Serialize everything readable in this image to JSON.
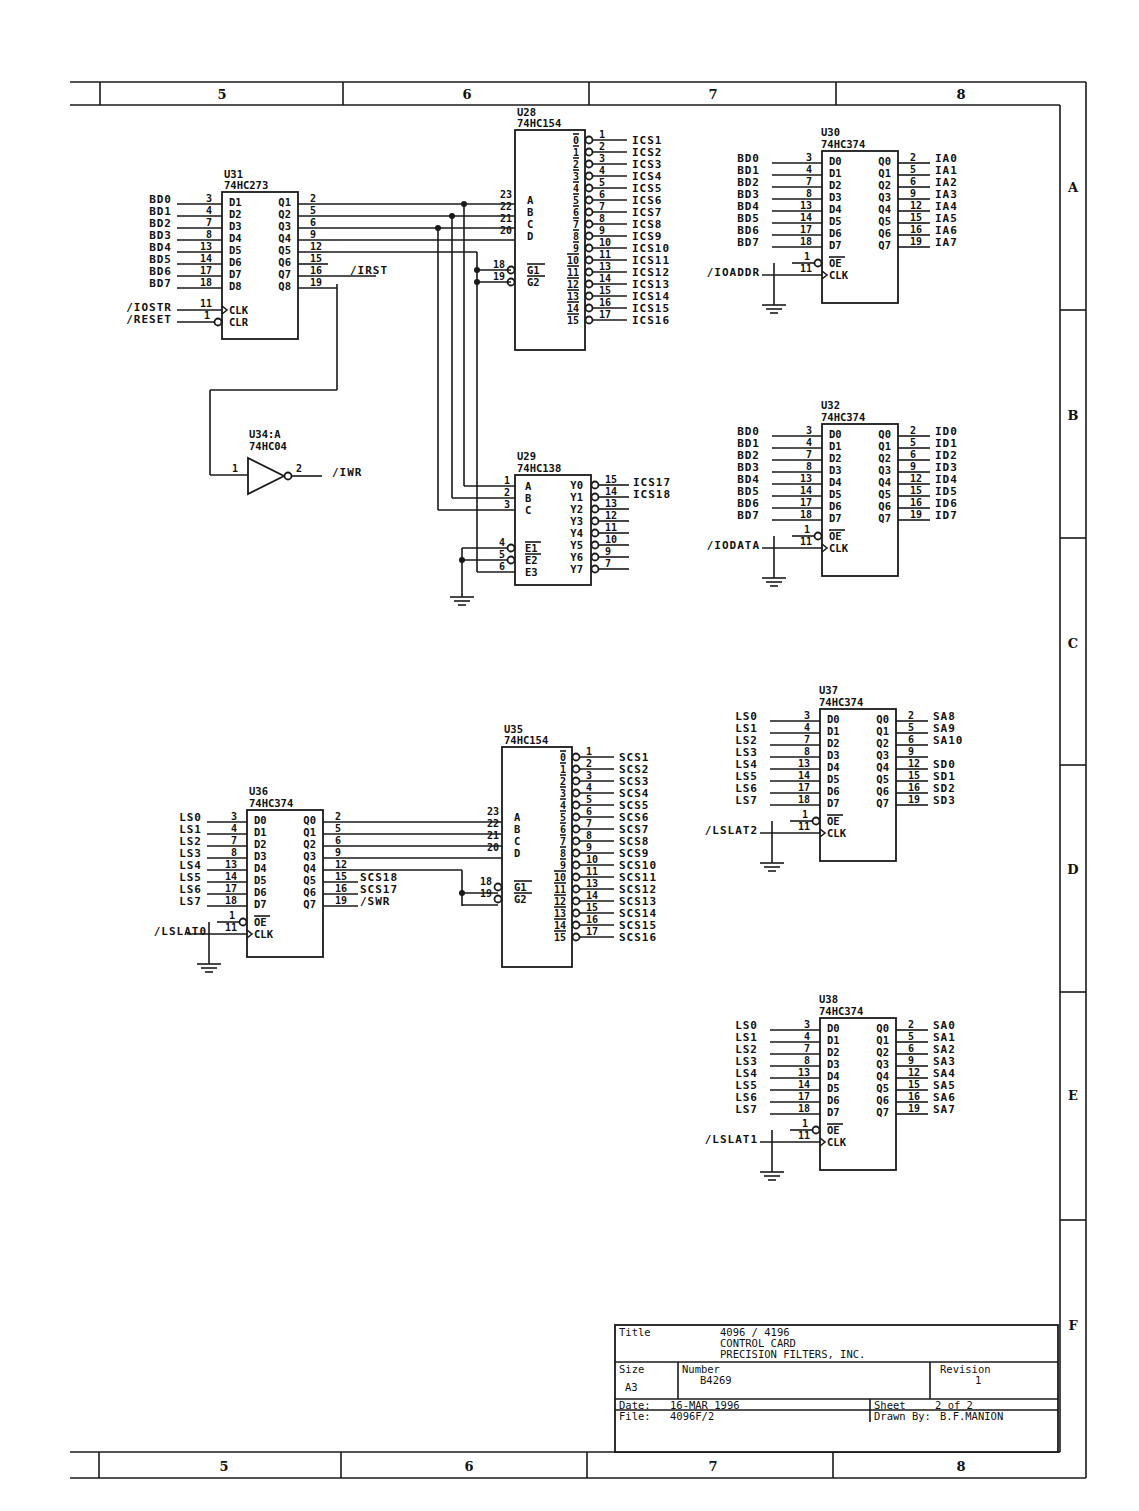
{
  "border": {
    "columns": [
      "5",
      "6",
      "7",
      "8"
    ],
    "rows": [
      "A",
      "B",
      "C",
      "D",
      "E",
      "F"
    ]
  },
  "chips": {
    "u31": {
      "ref": "U31",
      "part": "74HC273",
      "inputs": [
        {
          "sig": "BD0",
          "pin": "3",
          "name": "D1"
        },
        {
          "sig": "BD1",
          "pin": "4",
          "name": "D2"
        },
        {
          "sig": "BD2",
          "pin": "7",
          "name": "D3"
        },
        {
          "sig": "BD3",
          "pin": "8",
          "name": "D4"
        },
        {
          "sig": "BD4",
          "pin": "13",
          "name": "D5"
        },
        {
          "sig": "BD5",
          "pin": "14",
          "name": "D6"
        },
        {
          "sig": "BD6",
          "pin": "17",
          "name": "D7"
        },
        {
          "sig": "BD7",
          "pin": "18",
          "name": "D8"
        }
      ],
      "outputs": [
        {
          "pin": "2",
          "name": "Q1"
        },
        {
          "pin": "5",
          "name": "Q2"
        },
        {
          "pin": "6",
          "name": "Q3"
        },
        {
          "pin": "9",
          "name": "Q4"
        },
        {
          "pin": "12",
          "name": "Q5"
        },
        {
          "pin": "15",
          "name": "Q6"
        },
        {
          "pin": "16",
          "name": "Q7",
          "sig": "/IRST"
        },
        {
          "pin": "19",
          "name": "Q8"
        }
      ],
      "clk": {
        "sig": "/IOSTR",
        "pin": "11",
        "name": "CLK"
      },
      "clr": {
        "sig": "/RESET",
        "pin": "1",
        "name": "CLR"
      }
    },
    "u28": {
      "ref": "U28",
      "part": "74HC154",
      "inputs": [
        {
          "pin": "23",
          "name": "A"
        },
        {
          "pin": "22",
          "name": "B"
        },
        {
          "pin": "21",
          "name": "C"
        },
        {
          "pin": "20",
          "name": "D"
        }
      ],
      "gates": [
        {
          "pin": "18",
          "name": "G1"
        },
        {
          "pin": "19",
          "name": "G2"
        }
      ],
      "outputs": [
        {
          "n": "0",
          "pin": "1",
          "sig": "ICS1"
        },
        {
          "n": "1",
          "pin": "2",
          "sig": "ICS2"
        },
        {
          "n": "2",
          "pin": "3",
          "sig": "ICS3"
        },
        {
          "n": "3",
          "pin": "4",
          "sig": "ICS4"
        },
        {
          "n": "4",
          "pin": "5",
          "sig": "ICS5"
        },
        {
          "n": "5",
          "pin": "6",
          "sig": "ICS6"
        },
        {
          "n": "6",
          "pin": "7",
          "sig": "ICS7"
        },
        {
          "n": "7",
          "pin": "8",
          "sig": "ICS8"
        },
        {
          "n": "8",
          "pin": "9",
          "sig": "ICS9"
        },
        {
          "n": "9",
          "pin": "10",
          "sig": "ICS10"
        },
        {
          "n": "10",
          "pin": "11",
          "sig": "ICS11"
        },
        {
          "n": "11",
          "pin": "13",
          "sig": "ICS12"
        },
        {
          "n": "12",
          "pin": "14",
          "sig": "ICS13"
        },
        {
          "n": "13",
          "pin": "15",
          "sig": "ICS14"
        },
        {
          "n": "14",
          "pin": "16",
          "sig": "ICS15"
        },
        {
          "n": "15",
          "pin": "17",
          "sig": "ICS16"
        }
      ]
    },
    "u29": {
      "ref": "U29",
      "part": "74HC138",
      "inputs": [
        {
          "pin": "1",
          "name": "A"
        },
        {
          "pin": "2",
          "name": "B"
        },
        {
          "pin": "3",
          "name": "C"
        }
      ],
      "enables": [
        {
          "pin": "4",
          "name": "E1"
        },
        {
          "pin": "5",
          "name": "E2"
        },
        {
          "pin": "6",
          "name": "E3"
        }
      ],
      "outputs": [
        {
          "name": "Y0",
          "pin": "15",
          "sig": "ICS17"
        },
        {
          "name": "Y1",
          "pin": "14",
          "sig": "ICS18"
        },
        {
          "name": "Y2",
          "pin": "13"
        },
        {
          "name": "Y3",
          "pin": "12"
        },
        {
          "name": "Y4",
          "pin": "11"
        },
        {
          "name": "Y5",
          "pin": "10"
        },
        {
          "name": "Y6",
          "pin": "9"
        },
        {
          "name": "Y7",
          "pin": "7"
        }
      ]
    },
    "u34": {
      "ref": "U34:A",
      "part": "74HC04",
      "in_pin": "1",
      "out_pin": "2",
      "out_sig": "/IWR"
    },
    "u30": {
      "ref": "U30",
      "part": "74HC374",
      "clk_sig": "/IOADDR",
      "in_sigs": [
        "BD0",
        "BD1",
        "BD2",
        "BD3",
        "BD4",
        "BD5",
        "BD6",
        "BD7"
      ],
      "out_sigs": [
        "IA0",
        "IA1",
        "IA2",
        "IA3",
        "IA4",
        "IA5",
        "IA6",
        "IA7"
      ]
    },
    "u32": {
      "ref": "U32",
      "part": "74HC374",
      "clk_sig": "/IODATA",
      "in_sigs": [
        "BD0",
        "BD1",
        "BD2",
        "BD3",
        "BD4",
        "BD5",
        "BD6",
        "BD7"
      ],
      "out_sigs": [
        "ID0",
        "ID1",
        "ID2",
        "ID3",
        "ID4",
        "ID5",
        "ID6",
        "ID7"
      ]
    },
    "u37": {
      "ref": "U37",
      "part": "74HC374",
      "clk_sig": "/LSLAT2",
      "in_sigs": [
        "LS0",
        "LS1",
        "LS2",
        "LS3",
        "LS4",
        "LS5",
        "LS6",
        "LS7"
      ],
      "out_sigs": [
        "SA8",
        "SA9",
        "SA10",
        "",
        "SD0",
        "SD1",
        "SD2",
        "SD3"
      ]
    },
    "u38": {
      "ref": "U38",
      "part": "74HC374",
      "clk_sig": "/LSLAT1",
      "in_sigs": [
        "LS0",
        "LS1",
        "LS2",
        "LS3",
        "LS4",
        "LS5",
        "LS6",
        "LS7"
      ],
      "out_sigs": [
        "SA0",
        "SA1",
        "SA2",
        "SA3",
        "SA4",
        "SA5",
        "SA6",
        "SA7"
      ]
    },
    "u36": {
      "ref": "U36",
      "part": "74HC374",
      "clk_sig": "/LSLAT0",
      "in_sigs": [
        "LS0",
        "LS1",
        "LS2",
        "LS3",
        "LS4",
        "LS5",
        "LS6",
        "LS7"
      ],
      "out_sigs": [
        "",
        "",
        "",
        "",
        "",
        "SCS18",
        "SCS17",
        "/SWR"
      ]
    },
    "u35": {
      "ref": "U35",
      "part": "74HC154",
      "out_sigs": [
        "SCS1",
        "SCS2",
        "SCS3",
        "SCS4",
        "SCS5",
        "SCS6",
        "SCS7",
        "SCS8",
        "SCS9",
        "SCS10",
        "SCS11",
        "SCS12",
        "SCS13",
        "SCS14",
        "SCS15",
        "SCS16"
      ]
    }
  },
  "hc374": {
    "in_pins": [
      "3",
      "4",
      "7",
      "8",
      "13",
      "14",
      "17",
      "18"
    ],
    "out_pins": [
      "2",
      "5",
      "6",
      "9",
      "12",
      "15",
      "16",
      "19"
    ],
    "d_names": [
      "D0",
      "D1",
      "D2",
      "D3",
      "D4",
      "D5",
      "D6",
      "D7"
    ],
    "q_names": [
      "Q0",
      "Q1",
      "Q2",
      "Q3",
      "Q4",
      "Q5",
      "Q6",
      "Q7"
    ],
    "oe_pin": "1",
    "oe_name": "OE",
    "clk_pin": "11",
    "clk_name": "CLK"
  },
  "title_block": {
    "title_label": "Title",
    "title_lines": [
      "4096 / 4196",
      "CONTROL CARD",
      "PRECISION FILTERS, INC."
    ],
    "size_label": "Size",
    "size": "A3",
    "number_label": "Number",
    "number": "B4269",
    "revision_label": "Revision",
    "revision": "1",
    "date_label": "Date:",
    "date": "16-MAR 1996",
    "file_label": "File:",
    "file": "4096F/2",
    "sheet_label": "Sheet",
    "sheet": "2 of 2",
    "drawn_label": "Drawn By:",
    "drawn": "B.F.MANION"
  }
}
